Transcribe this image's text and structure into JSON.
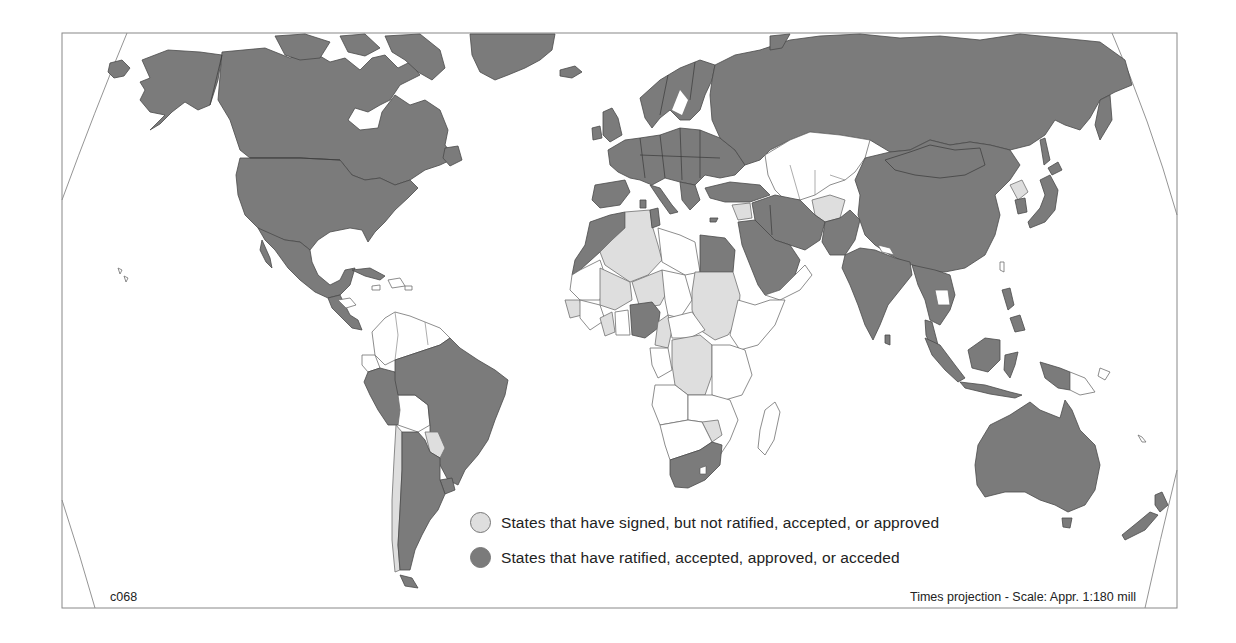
{
  "map": {
    "code": "c068",
    "projection_note": "Times projection - Scale: Appr. 1:180 mill",
    "colors": {
      "ratified": "#7b7b7b",
      "signed_only": "#dedede",
      "not_party": "#ffffff",
      "frame": "#888888"
    },
    "legend": [
      {
        "key": "signed_only",
        "label": "States that have signed, but not ratified, accepted, or approved",
        "color": "#dedede"
      },
      {
        "key": "ratified",
        "label": "States that have ratified, accepted, approved, or acceded",
        "color": "#7b7b7b"
      }
    ],
    "regions": {
      "ratified": [
        "Canada",
        "United States",
        "Greenland",
        "Mexico",
        "Cuba",
        "Guatemala",
        "Honduras",
        "Nicaragua",
        "Brazil",
        "Peru",
        "Argentina",
        "Uruguay",
        "Russia",
        "Europe",
        "Morocco",
        "Tunisia",
        "Egypt",
        "Nigeria",
        "South Africa",
        "Turkey",
        "Iraq",
        "Iran",
        "Saudi Arabia",
        "Pakistan",
        "India",
        "China",
        "Mongolia",
        "South Korea",
        "Japan",
        "Myanmar",
        "Thailand",
        "Malaysia",
        "Indonesia",
        "Philippines",
        "Australia",
        "New Zealand"
      ],
      "signed_only": [
        "Algeria",
        "Mali",
        "Niger",
        "Sudan",
        "DR Congo",
        "Chile",
        "Paraguay",
        "Afghanistan",
        "North Korea",
        "Syria",
        "Zimbabwe",
        "Senegal",
        "Ghana",
        "Cameroon"
      ]
    }
  }
}
